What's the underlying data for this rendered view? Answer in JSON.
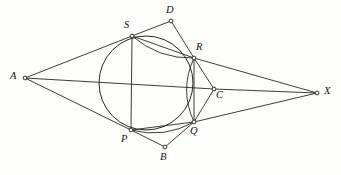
{
  "figure": {
    "canvas": {
      "width": 341,
      "height": 175
    },
    "stroke_color": "#2a2724",
    "background_color": "#fdfdfc",
    "label_color": "#141312"
  },
  "circle": {
    "name": "circumcircle-pqrs",
    "cx": 146,
    "cy": 83,
    "r": 47
  },
  "points": [
    {
      "id": "A",
      "label": "A",
      "x": 25,
      "y": 78,
      "label_x": 10,
      "label_y": 71
    },
    {
      "id": "S",
      "label": "S",
      "x": 132,
      "y": 36,
      "label_x": 124,
      "label_y": 20
    },
    {
      "id": "D",
      "label": "D",
      "x": 171,
      "y": 21,
      "label_x": 166,
      "label_y": 5
    },
    {
      "id": "R",
      "label": "R",
      "x": 194,
      "y": 58,
      "label_x": 196,
      "label_y": 42
    },
    {
      "id": "C",
      "label": "C",
      "x": 214,
      "y": 89,
      "label_x": 216,
      "label_y": 90
    },
    {
      "id": "X",
      "label": "X",
      "x": 317,
      "y": 93,
      "label_x": 324,
      "label_y": 86
    },
    {
      "id": "Q",
      "label": "Q",
      "x": 194,
      "y": 122,
      "label_x": 190,
      "label_y": 126
    },
    {
      "id": "B",
      "label": "B",
      "x": 165,
      "y": 147,
      "label_x": 160,
      "label_y": 152
    },
    {
      "id": "P",
      "label": "P",
      "x": 131,
      "y": 130,
      "label_x": 121,
      "label_y": 134
    }
  ],
  "segments": [
    {
      "name": "segment-A-S",
      "from": "A",
      "to": "S"
    },
    {
      "name": "segment-A-P",
      "from": "A",
      "to": "P"
    },
    {
      "name": "segment-A-C",
      "from": "A",
      "to": "C"
    },
    {
      "name": "segment-C-X",
      "from": "C",
      "to": "X"
    },
    {
      "name": "segment-S-R",
      "from": "S",
      "to": "R"
    },
    {
      "name": "segment-S-P",
      "from": "S",
      "to": "P"
    },
    {
      "name": "segment-S-D",
      "from": "S",
      "to": "D"
    },
    {
      "name": "segment-D-R",
      "from": "D",
      "to": "R"
    },
    {
      "name": "segment-R-X",
      "from": "R",
      "to": "X"
    },
    {
      "name": "segment-R-C",
      "from": "R",
      "to": "C"
    },
    {
      "name": "segment-R-Q",
      "from": "R",
      "to": "Q"
    },
    {
      "name": "segment-Q-C",
      "from": "Q",
      "to": "C"
    },
    {
      "name": "segment-Q-X",
      "from": "Q",
      "to": "X"
    },
    {
      "name": "segment-P-Q",
      "from": "P",
      "to": "Q"
    },
    {
      "name": "segment-P-B",
      "from": "P",
      "to": "B"
    },
    {
      "name": "segment-B-Q",
      "from": "B",
      "to": "Q"
    }
  ],
  "arcs": [
    {
      "name": "arc-S-R",
      "from": "S",
      "to": "R",
      "bulge": "up"
    },
    {
      "name": "arc-P-Q",
      "from": "P",
      "to": "Q",
      "bulge": "down"
    },
    {
      "name": "arc-R-Q",
      "from": "R",
      "to": "Q",
      "bulge": "right"
    }
  ]
}
